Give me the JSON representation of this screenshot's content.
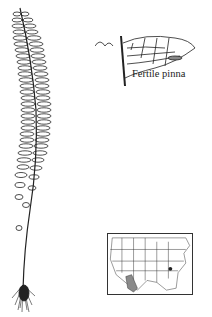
{
  "figure": {
    "inset_label": "Fertile pinna",
    "map": {
      "region": "United States distribution map",
      "shaded_area_color": "#8a8a8a",
      "marker_color": "#222222"
    }
  }
}
